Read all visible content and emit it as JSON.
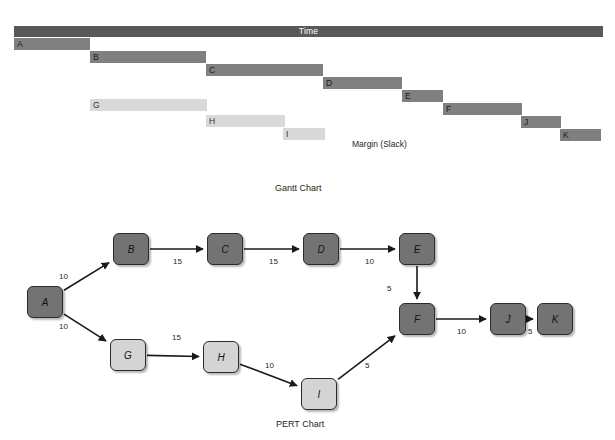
{
  "gantt": {
    "time_axis_label": "Time",
    "slack_note": "Margin (Slack)",
    "caption": "Gantt Chart",
    "colors": {
      "header": "#595959",
      "critical_bar": "#808080",
      "slack_bar": "#d9d9d9"
    },
    "bars": [
      {
        "label": "A",
        "kind": "critical",
        "x": 14,
        "y": 38,
        "width": 76
      },
      {
        "label": "B",
        "kind": "critical",
        "x": 90,
        "y": 51,
        "width": 116
      },
      {
        "label": "C",
        "kind": "critical",
        "x": 206,
        "y": 64,
        "width": 117
      },
      {
        "label": "D",
        "kind": "critical",
        "x": 323,
        "y": 77,
        "width": 79
      },
      {
        "label": "E",
        "kind": "critical",
        "x": 402,
        "y": 90,
        "width": 41
      },
      {
        "label": "F",
        "kind": "critical",
        "x": 443,
        "y": 103,
        "width": 79
      },
      {
        "label": "J",
        "kind": "critical",
        "x": 521,
        "y": 116,
        "width": 40
      },
      {
        "label": "K",
        "kind": "critical",
        "x": 560,
        "y": 129,
        "width": 41
      },
      {
        "label": "G",
        "kind": "slack",
        "x": 90,
        "y": 99,
        "width": 117
      },
      {
        "label": "H",
        "kind": "slack",
        "x": 206,
        "y": 115,
        "width": 79
      },
      {
        "label": "I",
        "kind": "slack",
        "x": 283,
        "y": 128,
        "width": 42
      }
    ]
  },
  "pert": {
    "caption": "PERT Chart",
    "colors": {
      "critical_node": "#737373",
      "slack_node": "#d4d4d4",
      "edge": "#1a1a1a"
    },
    "nodes": [
      {
        "id": "A",
        "label": "A",
        "kind": "critical",
        "x": 27,
        "y": 81
      },
      {
        "id": "B",
        "label": "B",
        "kind": "critical",
        "x": 113,
        "y": 28
      },
      {
        "id": "C",
        "label": "C",
        "kind": "critical",
        "x": 207,
        "y": 28
      },
      {
        "id": "D",
        "label": "D",
        "kind": "critical",
        "x": 303,
        "y": 28
      },
      {
        "id": "E",
        "label": "E",
        "kind": "critical",
        "x": 399,
        "y": 28
      },
      {
        "id": "F",
        "label": "F",
        "kind": "critical",
        "x": 399,
        "y": 98
      },
      {
        "id": "J",
        "label": "J",
        "kind": "critical",
        "x": 490,
        "y": 98
      },
      {
        "id": "K",
        "label": "K",
        "kind": "critical",
        "x": 537,
        "y": 98
      },
      {
        "id": "G",
        "label": "G",
        "kind": "slack",
        "x": 110,
        "y": 134
      },
      {
        "id": "H",
        "label": "H",
        "kind": "slack",
        "x": 203,
        "y": 136
      },
      {
        "id": "I",
        "label": "I",
        "kind": "slack",
        "x": 301,
        "y": 173
      }
    ],
    "edges": [
      {
        "from": "A",
        "to": "B",
        "weight": "10",
        "lx": 59,
        "ly": 67
      },
      {
        "from": "B",
        "to": "C",
        "weight": "15",
        "lx": 173,
        "ly": 52
      },
      {
        "from": "C",
        "to": "D",
        "weight": "15",
        "lx": 269,
        "ly": 52
      },
      {
        "from": "D",
        "to": "E",
        "weight": "10",
        "lx": 365,
        "ly": 52
      },
      {
        "from": "E",
        "to": "F",
        "weight": "5",
        "lx": 387,
        "ly": 79
      },
      {
        "from": "A",
        "to": "G",
        "weight": "10",
        "lx": 59,
        "ly": 117
      },
      {
        "from": "G",
        "to": "H",
        "weight": "15",
        "lx": 172,
        "ly": 128
      },
      {
        "from": "H",
        "to": "I",
        "weight": "10",
        "lx": 265,
        "ly": 156
      },
      {
        "from": "I",
        "to": "F",
        "weight": "5",
        "lx": 365,
        "ly": 156
      },
      {
        "from": "F",
        "to": "J",
        "weight": "10",
        "lx": 457,
        "ly": 122
      },
      {
        "from": "J",
        "to": "K",
        "weight": "5",
        "lx": 528,
        "ly": 122
      }
    ]
  },
  "chart_data": {
    "type": "bar",
    "xlabel": "Time",
    "ylabel": "Activity",
    "categories": [
      "A",
      "B",
      "C",
      "D",
      "E",
      "F",
      "J",
      "K",
      "G",
      "H",
      "I"
    ],
    "series": [
      {
        "name": "Critical path duration",
        "values": [
          10,
          15,
          15,
          10,
          5,
          10,
          5,
          5,
          null,
          null,
          null
        ]
      },
      {
        "name": "Margin (Slack)",
        "values": [
          null,
          null,
          null,
          null,
          null,
          null,
          null,
          null,
          10,
          15,
          10
        ]
      }
    ],
    "legend": [
      "Time",
      "Margin (Slack)"
    ],
    "grid": false,
    "annotations": [
      "A → B = 10",
      "B → C = 15",
      "C → D = 15",
      "D → E = 10",
      "E → F = 5",
      "A → G = 10",
      "G → H = 15",
      "H → I = 10",
      "I → F = 5",
      "F → J = 10",
      "J → K = 5"
    ]
  }
}
